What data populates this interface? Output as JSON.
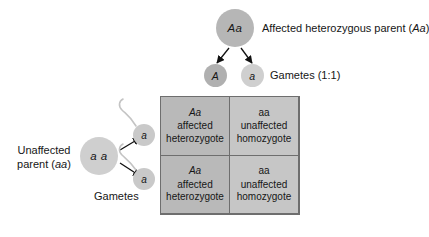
{
  "diagram": {
    "colors": {
      "parent_affected": "#b6b6b6",
      "parent_unaffected": "#cfcfcf",
      "gamete_A": "#b0b0b0",
      "gamete_a": "#cfcfcf",
      "square_fill": "#b9b9b9",
      "square_fill_light": "#c6c6c6",
      "line": "#6e6e6e",
      "background": "#ffffff"
    }
  },
  "top_parent": {
    "circle_label": "Aa",
    "description": "Affected heterozygous parent (",
    "description_genotype": "Aa",
    "description_end": ")"
  },
  "top_gametes": {
    "gamete_1": "A",
    "gamete_2": "a",
    "label": "Gametes (1:1)"
  },
  "left_parent": {
    "circle_label": "a a",
    "description_line1": "Unaffected",
    "description_line2_prefix": "parent (",
    "description_line2_genotype": "aa",
    "description_line2_end": ")"
  },
  "left_gametes": {
    "gamete_1": "a",
    "gamete_2": "a",
    "label": "Gametes"
  },
  "punnett_square": {
    "cells": [
      {
        "genotype": "Aa",
        "phenotype": "affected",
        "zygosity": "heterozygote"
      },
      {
        "genotype": "aa",
        "phenotype": "unaffected",
        "zygosity": "homozygote"
      },
      {
        "genotype": "Aa",
        "phenotype": "affected",
        "zygosity": "heterozygote"
      },
      {
        "genotype": "aa",
        "phenotype": "unaffected",
        "zygosity": "homozygote"
      }
    ]
  }
}
